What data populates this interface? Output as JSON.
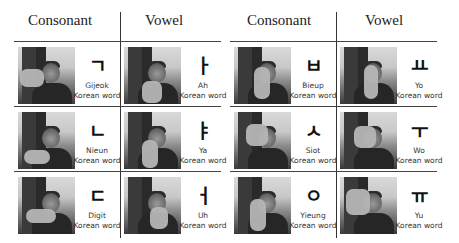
{
  "tables": [
    {
      "headers": {
        "consonant": "Consonant",
        "vowel": "Vowel"
      },
      "rows": [
        {
          "consonant": {
            "jamo": "ㄱ",
            "name": "Gijeok",
            "subtitle": "Korean word"
          },
          "vowel": {
            "jamo": "ㅏ",
            "name": "Ah",
            "subtitle": "Korean word"
          }
        },
        {
          "consonant": {
            "jamo": "ㄴ",
            "name": "Nieun",
            "subtitle": "Korean word"
          },
          "vowel": {
            "jamo": "ㅑ",
            "name": "Ya",
            "subtitle": "Korean word"
          }
        },
        {
          "consonant": {
            "jamo": "ㄷ",
            "name": "Digit",
            "subtitle": "Korean word"
          },
          "vowel": {
            "jamo": "ㅓ",
            "name": "Uh",
            "subtitle": "Korean word"
          }
        }
      ]
    },
    {
      "headers": {
        "consonant": "Consonant",
        "vowel": "Vowel"
      },
      "rows": [
        {
          "consonant": {
            "jamo": "ㅂ",
            "name": "Bieup",
            "subtitle": "Korean word"
          },
          "vowel": {
            "jamo": "ㅛ",
            "name": "Yo",
            "subtitle": "Korean word"
          }
        },
        {
          "consonant": {
            "jamo": "ㅅ",
            "name": "Siot",
            "subtitle": "Korean word"
          },
          "vowel": {
            "jamo": "ㅜ",
            "name": "Wo",
            "subtitle": "Korean word"
          }
        },
        {
          "consonant": {
            "jamo": "ㅇ",
            "name": "Yieung",
            "subtitle": "Korean word"
          },
          "vowel": {
            "jamo": "ㅠ",
            "name": "Yu",
            "subtitle": "Korean word"
          }
        }
      ]
    }
  ]
}
